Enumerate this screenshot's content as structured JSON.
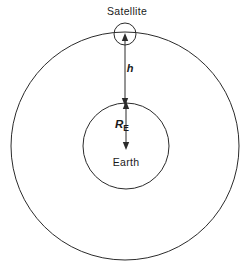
{
  "figure": {
    "background_color": "#ffffff",
    "line_color": "#2b2b2b",
    "text_color": "#1a1a1a"
  },
  "labels": {
    "satellite": "Satellite",
    "earth": "Earth",
    "altitude": "h",
    "radius_symbol": "R",
    "radius_subscript": "E"
  },
  "geometry": {
    "orbit": {
      "cx": 125,
      "cy": 146,
      "r": 114,
      "name": "orbit-circle"
    },
    "earth": {
      "cx": 126,
      "cy": 146,
      "r": 43,
      "name": "earth-circle"
    },
    "satellite": {
      "cx": 125,
      "cy": 34,
      "r": 11,
      "name": "satellite-circle"
    },
    "altitude_arrow": {
      "x": 125,
      "y_top": 36,
      "y_bottom": 103
    },
    "radius_arrow": {
      "x": 126,
      "y_top": 104,
      "y_bottom": 147
    }
  }
}
